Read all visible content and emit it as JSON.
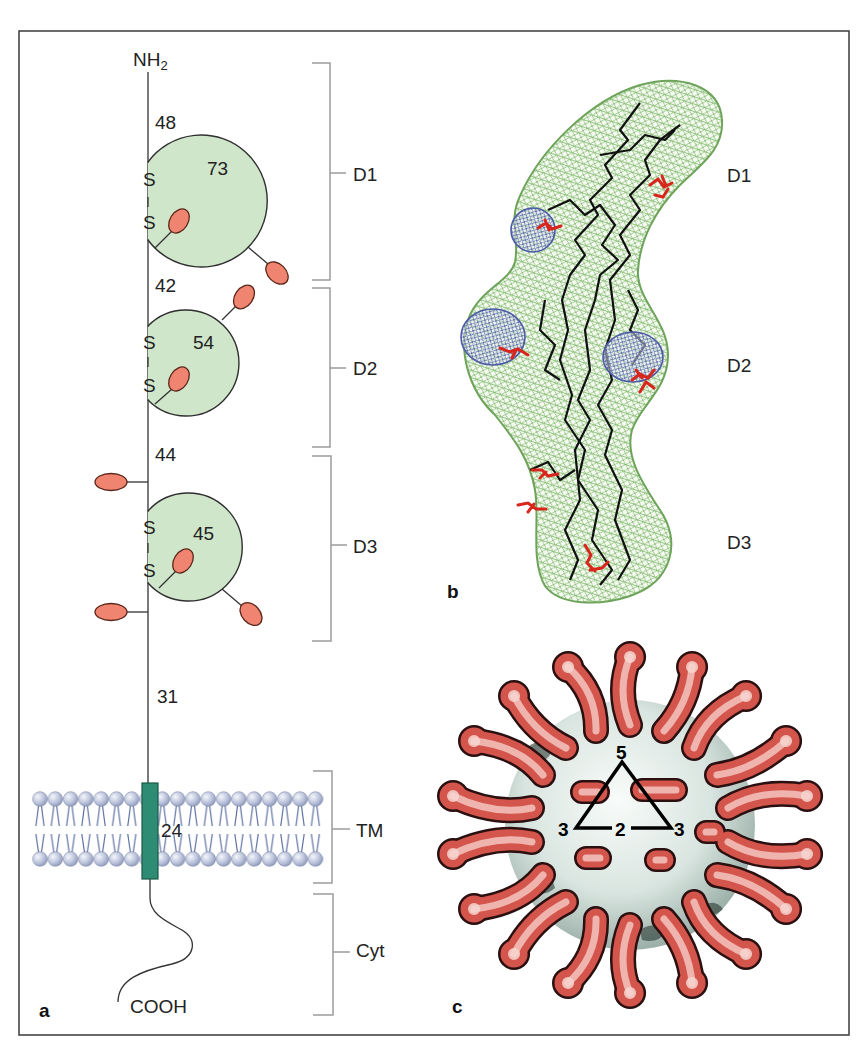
{
  "figure": {
    "panel_a": {
      "label": "a",
      "n_terminus": {
        "main": "NH",
        "subscript": "2"
      },
      "c_terminus": "COOH",
      "disulfide_atom": "S",
      "residue_counts": {
        "linker_before_d1": "48",
        "d1_loop": "73",
        "linker_before_d2": "42",
        "d2_loop": "54",
        "linker_before_d3": "44",
        "d3_loop": "45",
        "stalk": "31",
        "transmembrane": "24"
      },
      "regions": [
        {
          "id": "D1",
          "label": "D1"
        },
        {
          "id": "D2",
          "label": "D2"
        },
        {
          "id": "D3",
          "label": "D3"
        },
        {
          "id": "TM",
          "label": "TM"
        },
        {
          "id": "Cyt",
          "label": "Cyt"
        }
      ]
    },
    "panel_b": {
      "label": "b",
      "domains": [
        {
          "id": "D1",
          "label": "D1"
        },
        {
          "id": "D2",
          "label": "D2"
        },
        {
          "id": "D3",
          "label": "D3"
        }
      ]
    },
    "panel_c": {
      "label": "c",
      "symmetry_axes": {
        "five_fold": "5",
        "three_fold_left": "3",
        "two_fold": "2",
        "three_fold_right": "3"
      }
    }
  },
  "colors": {
    "domain_fill": "#cfe6cb",
    "glycan": "#ef8570",
    "transmembrane_segment": "#2e8b74",
    "lipid_head": "#b4bdd8",
    "density_mesh": "#7fb86b",
    "receptor_mesh": "#4b5aa6",
    "virus_spike": "#d4554c",
    "virus_core": "#dfe8e4"
  }
}
